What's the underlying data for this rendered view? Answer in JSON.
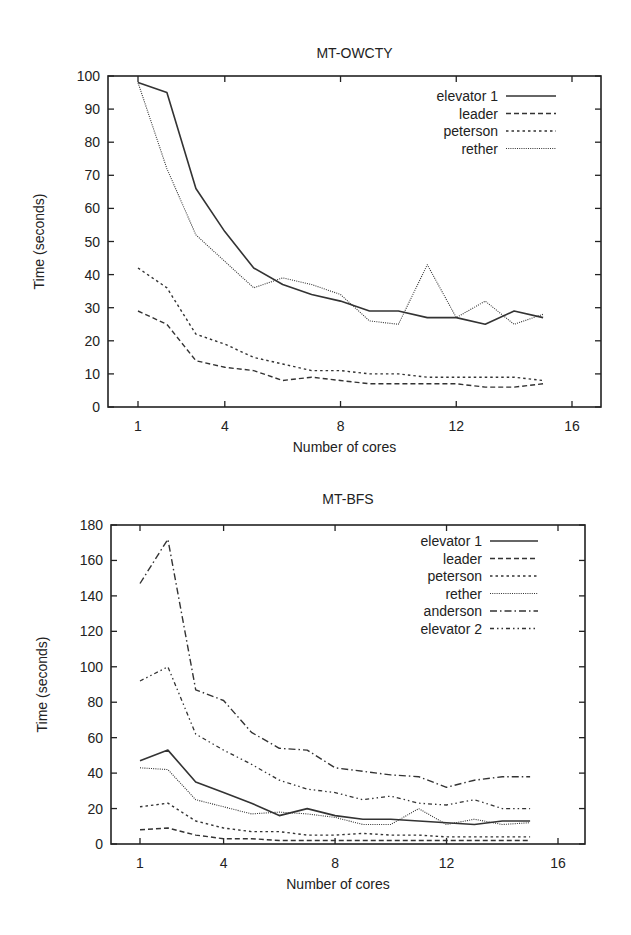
{
  "chart_data": [
    {
      "type": "line",
      "title": "MT-OWCTY",
      "xlabel": "Number of cores",
      "ylabel": "Time (seconds)",
      "xlim": [
        0,
        17.5
      ],
      "ylim": [
        0,
        100
      ],
      "xticks": [
        1,
        4,
        8,
        12,
        16
      ],
      "yticks": [
        0,
        10,
        20,
        30,
        40,
        50,
        60,
        70,
        80,
        90,
        100
      ],
      "grid": false,
      "legend_position": "top-right",
      "x": [
        1,
        2,
        3,
        4,
        5,
        6,
        7,
        8,
        9,
        10,
        11,
        12,
        13,
        14,
        15
      ],
      "series": [
        {
          "name": "elevator 1",
          "style": "solid",
          "values": [
            98,
            95,
            66,
            53,
            42,
            37,
            34,
            32,
            29,
            29,
            27,
            27,
            25,
            29,
            27
          ]
        },
        {
          "name": "leader",
          "style": "dashed",
          "values": [
            29,
            25,
            14,
            12,
            11,
            8,
            9,
            8,
            7,
            7,
            7,
            7,
            6,
            6,
            7
          ]
        },
        {
          "name": "peterson",
          "style": "dotted-short",
          "values": [
            42,
            36,
            22,
            19,
            15,
            13,
            11,
            11,
            10,
            10,
            9,
            9,
            9,
            9,
            8
          ]
        },
        {
          "name": "rether",
          "style": "dotted-fine",
          "values": [
            98,
            72,
            52,
            44,
            36,
            39,
            37,
            34,
            26,
            25,
            43,
            27,
            32,
            25,
            28
          ]
        }
      ]
    },
    {
      "type": "line",
      "title": "MT-BFS",
      "xlabel": "Number of cores",
      "ylabel": "Time (seconds)",
      "xlim": [
        0,
        17.5
      ],
      "ylim": [
        0,
        180
      ],
      "xticks": [
        1,
        4,
        8,
        12,
        16
      ],
      "yticks": [
        0,
        20,
        40,
        60,
        80,
        100,
        120,
        140,
        160,
        180
      ],
      "grid": false,
      "legend_position": "top-right",
      "x": [
        1,
        2,
        3,
        4,
        5,
        6,
        7,
        8,
        9,
        10,
        11,
        12,
        13,
        14,
        15
      ],
      "series": [
        {
          "name": "elevator 1",
          "style": "solid",
          "values": [
            47,
            53,
            35,
            29,
            23,
            16,
            20,
            16,
            14,
            14,
            13,
            12,
            11,
            13,
            13
          ]
        },
        {
          "name": "leader",
          "style": "dashed",
          "values": [
            8,
            9,
            5,
            3,
            3,
            2,
            2,
            2,
            2,
            2,
            2,
            2,
            2,
            2,
            2
          ]
        },
        {
          "name": "peterson",
          "style": "dotted-short",
          "values": [
            21,
            23,
            13,
            9,
            7,
            7,
            5,
            5,
            6,
            5,
            5,
            4,
            4,
            4,
            4
          ]
        },
        {
          "name": "rether",
          "style": "dotted-fine",
          "values": [
            43,
            42,
            25,
            21,
            17,
            18,
            17,
            15,
            11,
            11,
            20,
            11,
            14,
            11,
            12
          ]
        },
        {
          "name": "anderson",
          "style": "dash-dot",
          "values": [
            147,
            172,
            87,
            81,
            63,
            54,
            53,
            43,
            41,
            39,
            38,
            32,
            36,
            38,
            38
          ]
        },
        {
          "name": "elevator 2",
          "style": "dash-dot-dot",
          "values": [
            92,
            100,
            62,
            53,
            45,
            36,
            31,
            29,
            25,
            27,
            23,
            22,
            25,
            20,
            20
          ]
        }
      ]
    }
  ],
  "charts": [
    {
      "title": "MT-OWCTY",
      "xlabel": "Number of cores",
      "ylabel": "Time (seconds)"
    },
    {
      "title": "MT-BFS",
      "xlabel": "Number of cores",
      "ylabel": "Time (seconds)"
    }
  ],
  "colors": {
    "axis": "#222222",
    "line": "#333333",
    "background": "#ffffff"
  }
}
